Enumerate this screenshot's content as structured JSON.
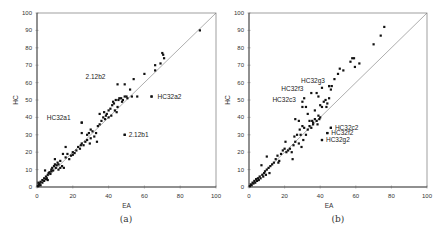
{
  "chart_data": [
    {
      "type": "scatter",
      "panel": "(a)",
      "xlabel": "EA",
      "ylabel": "HC",
      "xlim": [
        0,
        100
      ],
      "ylim": [
        0,
        100
      ],
      "xticks": [
        0,
        20,
        40,
        60,
        80,
        100
      ],
      "yticks": [
        0,
        10,
        20,
        30,
        40,
        50,
        60,
        70,
        80,
        90,
        100
      ],
      "grid": false,
      "reference_line": "y = x",
      "annotations": [
        {
          "label": "2.12b2",
          "x": 45,
          "y": 59
        },
        {
          "label": "HC32a2",
          "x": 64,
          "y": 52
        },
        {
          "label": "HC32a1",
          "x": 25,
          "y": 37
        },
        {
          "label": "2.12b1",
          "x": 49,
          "y": 30
        }
      ],
      "points": [
        [
          0.5,
          0.5
        ],
        [
          1,
          1.5
        ],
        [
          1,
          0.8
        ],
        [
          1.5,
          2
        ],
        [
          2,
          1
        ],
        [
          0.8,
          2.5
        ],
        [
          2,
          3
        ],
        [
          3,
          2.5
        ],
        [
          3,
          4
        ],
        [
          4,
          3.5
        ],
        [
          4,
          5
        ],
        [
          5,
          4.5
        ],
        [
          5,
          6
        ],
        [
          5.5,
          5
        ],
        [
          6,
          4
        ],
        [
          4.5,
          9.5
        ],
        [
          6,
          7
        ],
        [
          6.5,
          8
        ],
        [
          7,
          8.5
        ],
        [
          7.5,
          7.5
        ],
        [
          8,
          9
        ],
        [
          8,
          10
        ],
        [
          8.5,
          11
        ],
        [
          9,
          9.5
        ],
        [
          9.5,
          12
        ],
        [
          10,
          13
        ],
        [
          10,
          16
        ],
        [
          10.5,
          11
        ],
        [
          11,
          12.5
        ],
        [
          11.5,
          14
        ],
        [
          12,
          13
        ],
        [
          12,
          10
        ],
        [
          13,
          15
        ],
        [
          13,
          11
        ],
        [
          14,
          12
        ],
        [
          14.5,
          19
        ],
        [
          15,
          11
        ],
        [
          16,
          17
        ],
        [
          16,
          23
        ],
        [
          17,
          19
        ],
        [
          18,
          16
        ],
        [
          19,
          18
        ],
        [
          20,
          20
        ],
        [
          20,
          18.5
        ],
        [
          21,
          19.5
        ],
        [
          22,
          21
        ],
        [
          23,
          23
        ],
        [
          24,
          22
        ],
        [
          24.5,
          24
        ],
        [
          25,
          25
        ],
        [
          25,
          31
        ],
        [
          26,
          24
        ],
        [
          27,
          26
        ],
        [
          28,
          27
        ],
        [
          28,
          30
        ],
        [
          29,
          31
        ],
        [
          29.5,
          25
        ],
        [
          30,
          28
        ],
        [
          30,
          33
        ],
        [
          31,
          32
        ],
        [
          32,
          29
        ],
        [
          33,
          31
        ],
        [
          33.5,
          26
        ],
        [
          34,
          35
        ],
        [
          35,
          36
        ],
        [
          35,
          42
        ],
        [
          36,
          38
        ],
        [
          37,
          40
        ],
        [
          37.5,
          43
        ],
        [
          38,
          39
        ],
        [
          38.5,
          41
        ],
        [
          39,
          42
        ],
        [
          40,
          40
        ],
        [
          40,
          44
        ],
        [
          41,
          45
        ],
        [
          41.5,
          41
        ],
        [
          42,
          47
        ],
        [
          42.5,
          49
        ],
        [
          43,
          48
        ],
        [
          43.5,
          44
        ],
        [
          44,
          50
        ],
        [
          44.5,
          43
        ],
        [
          45,
          46
        ],
        [
          45.5,
          50
        ],
        [
          46,
          51
        ],
        [
          47,
          51
        ],
        [
          47.5,
          49
        ],
        [
          48,
          50
        ],
        [
          49,
          52
        ],
        [
          49,
          59
        ],
        [
          50,
          52
        ],
        [
          50.5,
          51
        ],
        [
          52,
          56
        ],
        [
          53,
          52
        ],
        [
          54,
          62
        ],
        [
          56,
          52
        ],
        [
          60,
          65
        ],
        [
          66,
          67
        ],
        [
          66,
          70
        ],
        [
          69,
          71
        ],
        [
          70,
          77
        ],
        [
          70.5,
          76
        ],
        [
          71,
          74
        ],
        [
          91,
          90
        ],
        [
          25,
          37
        ],
        [
          49,
          30
        ],
        [
          64,
          52
        ]
      ]
    },
    {
      "type": "scatter",
      "panel": "(b)",
      "xlabel": "EA",
      "ylabel": "HC",
      "xlim": [
        0,
        100
      ],
      "ylim": [
        0,
        100
      ],
      "xticks": [
        0,
        20,
        40,
        60,
        80,
        100
      ],
      "yticks": [
        0,
        10,
        20,
        30,
        40,
        50,
        60,
        70,
        80,
        90,
        100
      ],
      "grid": false,
      "reference_line": "y = x",
      "annotations": [
        {
          "label": "HC32g3",
          "x": 45,
          "y": 58
        },
        {
          "label": "HC32f3",
          "x": 35,
          "y": 54
        },
        {
          "label": "HC32c3",
          "x": 30,
          "y": 49
        },
        {
          "label": "HC32c2",
          "x": 46,
          "y": 34
        },
        {
          "label": "HC32f2",
          "x": 44,
          "y": 31
        },
        {
          "label": "HC32g2",
          "x": 41,
          "y": 27
        }
      ],
      "points": [
        [
          0.5,
          0.5
        ],
        [
          1,
          1.5
        ],
        [
          1.5,
          1
        ],
        [
          2,
          2.5
        ],
        [
          2.5,
          2
        ],
        [
          3,
          3.5
        ],
        [
          3.5,
          2.5
        ],
        [
          4,
          4.5
        ],
        [
          4.5,
          3.5
        ],
        [
          5,
          5
        ],
        [
          5.5,
          4
        ],
        [
          6,
          6
        ],
        [
          6.5,
          5
        ],
        [
          7,
          12.5
        ],
        [
          7.5,
          7
        ],
        [
          8,
          6
        ],
        [
          8.5,
          8
        ],
        [
          9,
          9
        ],
        [
          9.5,
          7
        ],
        [
          10,
          10
        ],
        [
          10,
          17.5
        ],
        [
          11,
          11
        ],
        [
          11.5,
          8
        ],
        [
          12,
          12
        ],
        [
          13,
          13
        ],
        [
          14,
          14
        ],
        [
          15,
          16
        ],
        [
          16,
          18
        ],
        [
          16.5,
          14
        ],
        [
          17,
          15
        ],
        [
          18,
          19
        ],
        [
          19,
          21
        ],
        [
          20,
          22
        ],
        [
          20.5,
          26
        ],
        [
          21,
          20
        ],
        [
          22,
          21
        ],
        [
          23,
          22
        ],
        [
          24,
          20
        ],
        [
          24.5,
          16
        ],
        [
          25,
          24
        ],
        [
          25.5,
          29
        ],
        [
          26,
          26
        ],
        [
          27,
          30
        ],
        [
          28,
          25
        ],
        [
          28.5,
          33
        ],
        [
          29,
          30
        ],
        [
          29.5,
          23
        ],
        [
          30,
          35
        ],
        [
          30.5,
          27
        ],
        [
          31,
          34
        ],
        [
          32,
          30
        ],
        [
          33,
          33
        ],
        [
          34,
          35
        ],
        [
          35,
          34
        ],
        [
          35.5,
          38
        ],
        [
          36,
          37
        ],
        [
          37,
          39
        ],
        [
          38,
          38
        ],
        [
          38.5,
          36
        ],
        [
          39,
          41
        ],
        [
          39.5,
          39
        ],
        [
          40,
          40
        ],
        [
          40,
          47
        ],
        [
          41,
          46
        ],
        [
          42,
          49
        ],
        [
          43,
          50
        ],
        [
          43.5,
          46
        ],
        [
          44,
          48
        ],
        [
          45,
          51
        ],
        [
          45,
          58
        ],
        [
          46,
          56
        ],
        [
          46.5,
          58
        ],
        [
          48,
          62
        ],
        [
          50,
          65
        ],
        [
          51,
          68
        ],
        [
          53,
          67
        ],
        [
          57,
          72
        ],
        [
          58,
          74
        ],
        [
          59,
          74
        ],
        [
          59.5,
          69
        ],
        [
          62,
          71
        ],
        [
          70,
          82
        ],
        [
          74,
          87
        ],
        [
          76,
          92
        ],
        [
          30,
          46
        ],
        [
          31,
          51
        ],
        [
          32,
          46
        ],
        [
          33,
          42
        ],
        [
          34,
          38
        ],
        [
          36,
          36
        ],
        [
          37,
          44
        ],
        [
          28,
          38
        ],
        [
          26,
          39
        ],
        [
          41,
          27
        ],
        [
          44,
          31
        ],
        [
          46,
          34
        ],
        [
          41,
          57
        ],
        [
          38,
          54
        ],
        [
          39,
          52
        ]
      ]
    }
  ],
  "captions": {
    "a": "(a)",
    "b": "(b)"
  }
}
